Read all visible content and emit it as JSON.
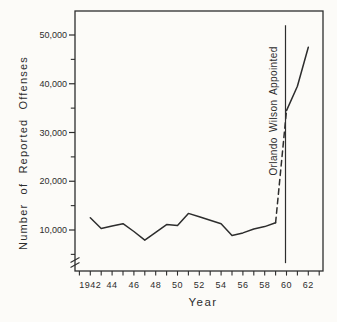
{
  "figure": {
    "background": "#fcfbf8",
    "ink": "#2d2d2d"
  },
  "chart_data": {
    "type": "line",
    "title": "",
    "xlabel": "Year",
    "ylabel": "Number of Reported Offenses",
    "x_range": [
      1941,
      1963
    ],
    "y_range": [
      0,
      52000
    ],
    "grid": false,
    "legend": "none",
    "axis_break_y": true,
    "y_ticks": [
      {
        "value": 10000,
        "label": "10,000"
      },
      {
        "value": 20000,
        "label": "20,000"
      },
      {
        "value": 30000,
        "label": "30,000"
      },
      {
        "value": 40000,
        "label": "40,000"
      },
      {
        "value": 50000,
        "label": "50,000"
      }
    ],
    "y_minor_ticks": [
      5000,
      15000,
      25000,
      35000,
      45000
    ],
    "x_tick_labels": [
      {
        "year": 1942,
        "label": "1942"
      },
      {
        "year": 1944,
        "label": "44"
      },
      {
        "year": 1946,
        "label": "46"
      },
      {
        "year": 1948,
        "label": "48"
      },
      {
        "year": 1950,
        "label": "50"
      },
      {
        "year": 1952,
        "label": "52"
      },
      {
        "year": 1954,
        "label": "54"
      },
      {
        "year": 1956,
        "label": "56"
      },
      {
        "year": 1958,
        "label": "58"
      },
      {
        "year": 1960,
        "label": "60"
      },
      {
        "year": 1962,
        "label": "62"
      }
    ],
    "annotation": {
      "label": "Orlando Wilson Appointed",
      "year": 1960,
      "line_value_range": [
        3200,
        52000
      ]
    },
    "series": [
      {
        "name": "reported-offenses-1942-1959",
        "style": "solid",
        "x": [
          1942,
          1943,
          1944,
          1945,
          1946,
          1947,
          1948,
          1949,
          1950,
          1951,
          1952,
          1953,
          1954,
          1955,
          1956,
          1957,
          1958,
          1959
        ],
        "y": [
          12500,
          10300,
          10800,
          11300,
          9700,
          7900,
          9500,
          11100,
          10900,
          13400,
          12700,
          12000,
          11300,
          8900,
          9400,
          10200,
          10700,
          11500
        ]
      },
      {
        "name": "reporting-change-transition",
        "style": "dashed",
        "x": [
          1959,
          1960
        ],
        "y": [
          11500,
          34500
        ]
      },
      {
        "name": "reported-offenses-1960-1962",
        "style": "solid",
        "x": [
          1960,
          1961,
          1962
        ],
        "y": [
          34500,
          39500,
          47500
        ]
      }
    ]
  }
}
